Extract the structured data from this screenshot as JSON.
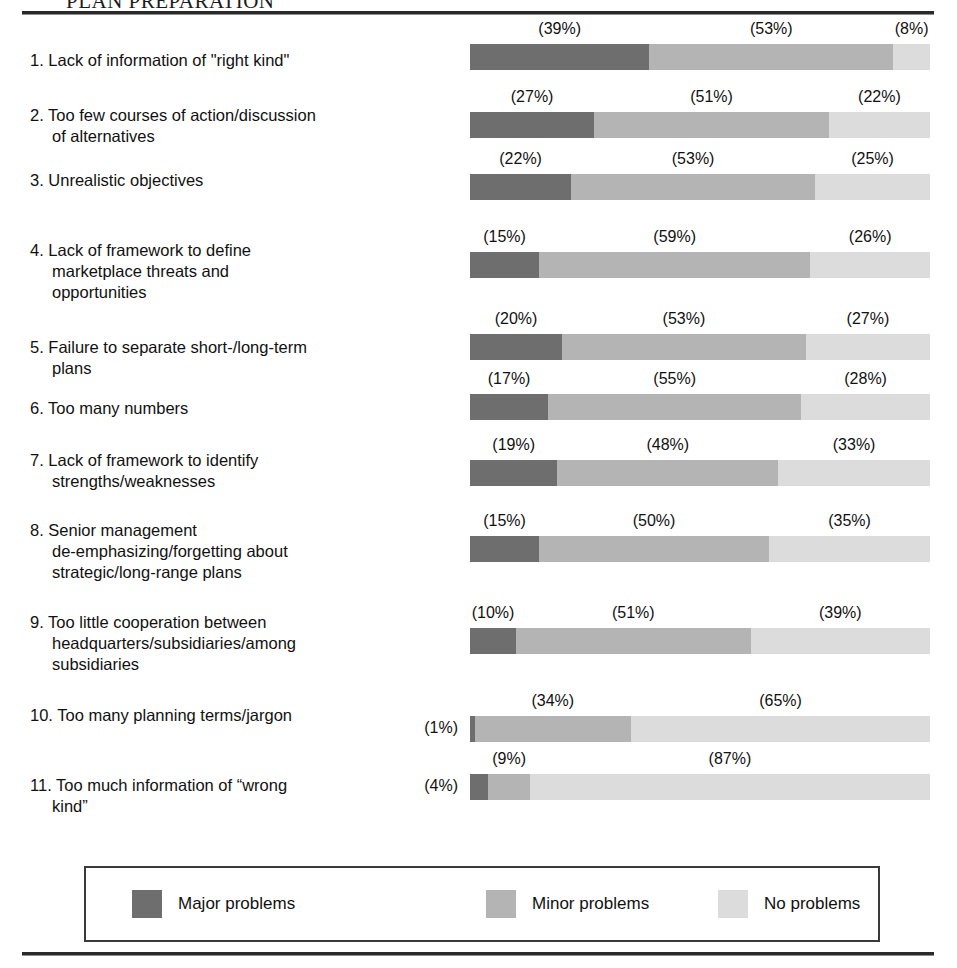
{
  "header": {
    "title": "PLAN PREPARATION"
  },
  "chart_data": {
    "type": "bar",
    "subtype": "stacked-horizontal-100pct",
    "title": "PLAN PREPARATION",
    "xlabel": "",
    "ylabel": "",
    "xlim": [
      0,
      100
    ],
    "grid": false,
    "value_format": "(N%)",
    "legend_position": "bottom",
    "legend": [
      "Major problems",
      "Minor problems",
      "No problems"
    ],
    "series": [
      {
        "name": "Major problems",
        "color": "#6e6e6e",
        "values": [
          39,
          27,
          22,
          15,
          20,
          17,
          19,
          15,
          10,
          1,
          4
        ]
      },
      {
        "name": "Minor problems",
        "color": "#b4b4b4",
        "values": [
          53,
          51,
          53,
          59,
          53,
          55,
          48,
          50,
          51,
          34,
          9
        ]
      },
      {
        "name": "No problems",
        "color": "#dcdcdc",
        "values": [
          8,
          22,
          25,
          26,
          27,
          28,
          33,
          35,
          39,
          65,
          87
        ]
      }
    ],
    "categories": [
      "1. Lack of information of \"right kind\"",
      "2. Too few courses of action/discussion\nof alternatives",
      "3. Unrealistic objectives",
      "4. Lack of framework to define\nmarketplace threats and\nopportunities",
      "5. Failure to separate short-/long-term\nplans",
      "6. Too many numbers",
      "7. Lack of framework to identify\nstrengths/weaknesses",
      "8. Senior management\nde-emphasizing/forgetting about\nstrategic/long-range plans",
      "9. Too little cooperation between\nheadquarters/subsidiaries/among\nsubsidiaries",
      "10. Too many planning terms/jargon",
      "11. Too much information of “wrong\nkind”"
    ]
  },
  "rows": [
    {
      "label": "1. Lack of information of \"right kind\"",
      "lead_pct": "",
      "segments": [
        {
          "key": "major",
          "value": 39,
          "label": "(39%)",
          "show_label": true
        },
        {
          "key": "minor",
          "value": 53,
          "label": "(53%)",
          "show_label": true
        },
        {
          "key": "none",
          "value": 8,
          "label": "(8%)",
          "show_label": true
        }
      ]
    },
    {
      "label": "2. Too few courses of action/discussion\nof alternatives",
      "lead_pct": "",
      "segments": [
        {
          "key": "major",
          "value": 27,
          "label": "(27%)",
          "show_label": true
        },
        {
          "key": "minor",
          "value": 51,
          "label": "(51%)",
          "show_label": true
        },
        {
          "key": "none",
          "value": 22,
          "label": "(22%)",
          "show_label": true
        }
      ]
    },
    {
      "label": "3. Unrealistic objectives",
      "lead_pct": "",
      "segments": [
        {
          "key": "major",
          "value": 22,
          "label": "(22%)",
          "show_label": true
        },
        {
          "key": "minor",
          "value": 53,
          "label": "(53%)",
          "show_label": true
        },
        {
          "key": "none",
          "value": 25,
          "label": "(25%)",
          "show_label": true
        }
      ]
    },
    {
      "label": "4. Lack of framework to define\nmarketplace threats and\nopportunities",
      "lead_pct": "",
      "segments": [
        {
          "key": "major",
          "value": 15,
          "label": "(15%)",
          "show_label": true
        },
        {
          "key": "minor",
          "value": 59,
          "label": "(59%)",
          "show_label": true
        },
        {
          "key": "none",
          "value": 26,
          "label": "(26%)",
          "show_label": true
        }
      ]
    },
    {
      "label": "5. Failure to separate short-/long-term\nplans",
      "lead_pct": "",
      "segments": [
        {
          "key": "major",
          "value": 20,
          "label": "(20%)",
          "show_label": true
        },
        {
          "key": "minor",
          "value": 53,
          "label": "(53%)",
          "show_label": true
        },
        {
          "key": "none",
          "value": 27,
          "label": "(27%)",
          "show_label": true
        }
      ]
    },
    {
      "label": "6. Too many numbers",
      "lead_pct": "",
      "segments": [
        {
          "key": "major",
          "value": 17,
          "label": "(17%)",
          "show_label": true
        },
        {
          "key": "minor",
          "value": 55,
          "label": "(55%)",
          "show_label": true
        },
        {
          "key": "none",
          "value": 28,
          "label": "(28%)",
          "show_label": true
        }
      ]
    },
    {
      "label": "7. Lack of framework to identify\nstrengths/weaknesses",
      "lead_pct": "",
      "segments": [
        {
          "key": "major",
          "value": 19,
          "label": "(19%)",
          "show_label": true
        },
        {
          "key": "minor",
          "value": 48,
          "label": "(48%)",
          "show_label": true
        },
        {
          "key": "none",
          "value": 33,
          "label": "(33%)",
          "show_label": true
        }
      ]
    },
    {
      "label": "8. Senior management\nde-emphasizing/forgetting about\nstrategic/long-range plans",
      "lead_pct": "",
      "segments": [
        {
          "key": "major",
          "value": 15,
          "label": "(15%)",
          "show_label": true
        },
        {
          "key": "minor",
          "value": 50,
          "label": "(50%)",
          "show_label": true
        },
        {
          "key": "none",
          "value": 35,
          "label": "(35%)",
          "show_label": true
        }
      ]
    },
    {
      "label": "9. Too little cooperation between\nheadquarters/subsidiaries/among\nsubsidiaries",
      "lead_pct": "",
      "segments": [
        {
          "key": "major",
          "value": 10,
          "label": "(10%)",
          "show_label": true
        },
        {
          "key": "minor",
          "value": 51,
          "label": "(51%)",
          "show_label": true
        },
        {
          "key": "none",
          "value": 39,
          "label": "(39%)",
          "show_label": true
        }
      ]
    },
    {
      "label": "10. Too many planning terms/jargon",
      "lead_pct": "(1%)",
      "segments": [
        {
          "key": "major",
          "value": 1,
          "label": "(1%)",
          "show_label": false
        },
        {
          "key": "minor",
          "value": 34,
          "label": "(34%)",
          "show_label": true
        },
        {
          "key": "none",
          "value": 65,
          "label": "(65%)",
          "show_label": true
        }
      ]
    },
    {
      "label": "11. Too much information of “wrong\nkind”",
      "lead_pct": "(4%)",
      "segments": [
        {
          "key": "major",
          "value": 4,
          "label": "(4%)",
          "show_label": false
        },
        {
          "key": "minor",
          "value": 9,
          "label": "(9%)",
          "show_label": true
        },
        {
          "key": "none",
          "value": 87,
          "label": "(87%)",
          "show_label": true
        }
      ]
    }
  ],
  "legend": {
    "items": [
      {
        "label": "Major problems",
        "key": "major",
        "color": "#6e6e6e"
      },
      {
        "label": "Minor problems",
        "key": "minor",
        "color": "#b4b4b4"
      },
      {
        "label": "No problems",
        "key": "none",
        "color": "#dcdcdc"
      }
    ]
  }
}
